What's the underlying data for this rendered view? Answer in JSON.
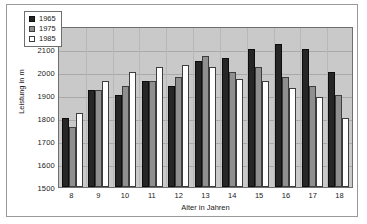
{
  "chart_data": {
    "type": "bar",
    "title": "",
    "xlabel": "Alter in Jahren",
    "ylabel": "Leistung in m",
    "categories": [
      "8",
      "9",
      "10",
      "11",
      "12",
      "13",
      "14",
      "15",
      "16",
      "17",
      "18"
    ],
    "series": [
      {
        "name": "1965",
        "color": "#262626",
        "values": [
          1800,
          1920,
          1900,
          1960,
          1940,
          2050,
          2060,
          2100,
          2120,
          2100,
          2000
        ]
      },
      {
        "name": "1975",
        "color": "#8f8f8f",
        "values": [
          1760,
          1920,
          1940,
          1960,
          1980,
          2070,
          2000,
          2020,
          1980,
          1940,
          1900
        ]
      },
      {
        "name": "1985",
        "color": "#ffffff",
        "values": [
          1820,
          1960,
          2000,
          2020,
          2030,
          2020,
          1970,
          1960,
          1930,
          1890,
          1800
        ]
      }
    ],
    "ylim": [
      1500,
      2200
    ],
    "ytick_values": [
      2200,
      2100,
      2000,
      1900,
      1800,
      1700,
      1600,
      1500
    ],
    "ytick_labels": [
      "2200",
      "2100",
      "2000",
      "1900",
      "1800",
      "1700",
      "1600",
      "1500"
    ],
    "grid": true,
    "legend_position": "top-left",
    "plot_background": "#c9c9c9",
    "figure_background": "#ffffff"
  }
}
